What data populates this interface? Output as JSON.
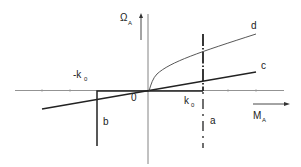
{
  "diagram": {
    "y_axis": {
      "symbol": "Ω",
      "subscript": "A"
    },
    "x_axis": {
      "symbol": "M",
      "subscript": "A"
    },
    "origin_label": "0",
    "tick_labels": {
      "neg_k0": {
        "symbol": "-k",
        "subscript": "0"
      },
      "pos_k0": {
        "symbol": "k",
        "subscript": "0"
      }
    },
    "curves": {
      "a": {
        "label": "a",
        "style": "dash-dot vertical at k0"
      },
      "b": {
        "label": "b",
        "style": "thick step at -k0"
      },
      "c": {
        "label": "c",
        "style": "straight line through origin"
      },
      "d": {
        "label": "d",
        "style": "concave curve from origin"
      }
    },
    "colors": {
      "ink": "#222222",
      "axis": "#555555",
      "background": "#ffffff"
    }
  }
}
